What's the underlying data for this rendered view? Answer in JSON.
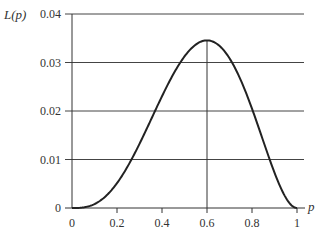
{
  "chart_data": {
    "type": "line",
    "title": "",
    "xlabel": "p",
    "ylabel": "L(p)",
    "xlim": [
      0,
      1
    ],
    "ylim": [
      0,
      0.04
    ],
    "grid": "horizontal",
    "legend": "none",
    "x_ticks": [
      "0",
      "0.2",
      "0.4",
      "0.6",
      "0.8",
      "1"
    ],
    "y_ticks": [
      "0",
      "0.01",
      "0.02",
      "0.03",
      "0.04"
    ],
    "annotations": [
      {
        "type": "vertical-line",
        "x": 0.6,
        "note": "maximum at p = 0.6"
      }
    ],
    "series": [
      {
        "name": "L(p)",
        "formula": "p^3 (1-p)^2",
        "x": [
          0,
          0.1,
          0.2,
          0.3,
          0.4,
          0.5,
          0.6,
          0.7,
          0.8,
          0.9,
          1.0
        ],
        "values": [
          0,
          0.00081,
          0.00512,
          0.01323,
          0.02304,
          0.03125,
          0.03456,
          0.03087,
          0.02048,
          0.00729,
          0
        ]
      }
    ]
  },
  "labels": {
    "ylabel": "L(p)",
    "xlabel": "p",
    "x_ticks": [
      "0",
      "0.2",
      "0.4",
      "0.6",
      "0.8",
      "1"
    ],
    "y_ticks": [
      "0",
      "0.01",
      "0.02",
      "0.03",
      "0.04"
    ]
  },
  "colors": {
    "axis": "#333333",
    "curve": "#222222",
    "grid": "#444444"
  }
}
